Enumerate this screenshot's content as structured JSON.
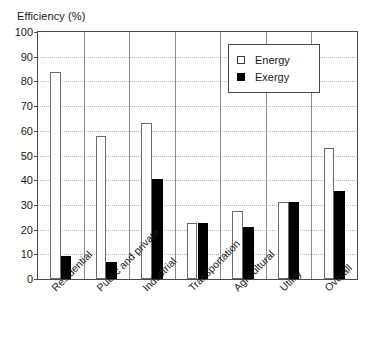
{
  "chart_data": {
    "type": "bar",
    "title": "Efficiency (%)",
    "xlabel": "",
    "ylabel": "Efficiency (%)",
    "ylim": [
      0,
      100
    ],
    "ytick_step": 10,
    "yticks": [
      0,
      10,
      20,
      30,
      40,
      50,
      60,
      70,
      80,
      90,
      100
    ],
    "grid": true,
    "grid_style": "dotted-horizontal",
    "legend_position": "top-right",
    "categories": [
      "Residential",
      "Public and private",
      "Industrial",
      "Transportation",
      "Agricultural",
      "Utility",
      "Overall"
    ],
    "series": [
      {
        "name": "Energy",
        "color": "#ffffff",
        "edge_color": "#6b6b6b",
        "values": [
          84,
          58,
          63,
          22.5,
          27.5,
          31,
          53
        ]
      },
      {
        "name": "Exergy",
        "color": "#000000",
        "edge_color": "#000000",
        "values": [
          9.5,
          7,
          40.5,
          22.5,
          21,
          31,
          35.5
        ]
      }
    ]
  },
  "axis": {
    "title": "Efficiency (%)",
    "y_max_label": "100",
    "y_min_label": "0"
  },
  "legend": {
    "items": [
      {
        "label": "Energy",
        "swatch": "open-square-icon"
      },
      {
        "label": "Exergy",
        "swatch": "filled-square-icon"
      }
    ]
  },
  "colors": {
    "frame": "#4a4a4a",
    "grid": "#b9b9b9",
    "separator": "#8d8d8d",
    "energy_fill": "#ffffff",
    "exergy_fill": "#000000",
    "text": "#1a1a1a",
    "background": "#ffffff"
  }
}
